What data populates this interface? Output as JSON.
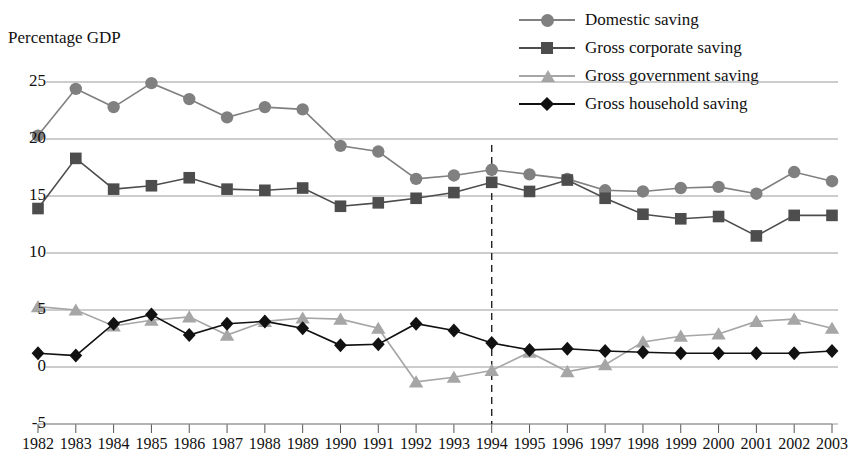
{
  "figure": {
    "title_fragment": "",
    "axis_title": "Percentage GDP"
  },
  "legend": {
    "position": "top-right",
    "items": [
      {
        "label": "Domestic saving",
        "marker": "circle-marker",
        "color": "#808080"
      },
      {
        "label": "Gross corporate saving",
        "marker": "square-marker",
        "color": "#4d4d4d"
      },
      {
        "label": "Gross government saving",
        "marker": "triangle-marker",
        "color": "#a6a6a6"
      },
      {
        "label": "Gross household saving",
        "marker": "diamond-marker",
        "color": "#111111"
      }
    ]
  },
  "annotations": {
    "vline_year": "1994",
    "vline_style": "dashed"
  },
  "chart_data": {
    "type": "line",
    "title": "",
    "xlabel": "",
    "ylabel": "Percentage GDP",
    "ylim": [
      -5,
      27
    ],
    "yticks": [
      -5,
      0,
      5,
      10,
      15,
      20,
      25
    ],
    "grid": true,
    "legend_position": "top-right",
    "x": [
      1982,
      1983,
      1984,
      1985,
      1986,
      1987,
      1988,
      1989,
      1990,
      1991,
      1992,
      1993,
      1994,
      1995,
      1996,
      1997,
      1998,
      1999,
      2000,
      2001,
      2002,
      2003
    ],
    "categories": [
      "1982",
      "1983",
      "1984",
      "1985",
      "1986",
      "1987",
      "1988",
      "1989",
      "1990",
      "1991",
      "1992",
      "1993",
      "1994",
      "1995",
      "1996",
      "1997",
      "1998",
      "1999",
      "2000",
      "2001",
      "2002",
      "2003"
    ],
    "series": [
      {
        "name": "Domestic saving",
        "color": "#808080",
        "marker": "circle",
        "values": [
          20.3,
          24.4,
          22.8,
          24.9,
          23.5,
          21.9,
          22.8,
          22.6,
          19.4,
          18.9,
          16.5,
          16.8,
          17.3,
          16.9,
          16.5,
          15.5,
          15.4,
          15.7,
          15.8,
          15.2,
          17.1,
          16.3
        ]
      },
      {
        "name": "Gross corporate saving",
        "color": "#4d4d4d",
        "marker": "square",
        "values": [
          13.9,
          18.3,
          15.6,
          15.9,
          16.6,
          15.6,
          15.5,
          15.7,
          14.1,
          14.4,
          14.8,
          15.3,
          16.2,
          15.4,
          16.4,
          14.8,
          13.4,
          13.0,
          13.2,
          11.5,
          13.3,
          13.3
        ]
      },
      {
        "name": "Gross government saving",
        "color": "#a6a6a6",
        "marker": "triangle",
        "values": [
          5.3,
          5.0,
          3.6,
          4.1,
          4.4,
          2.8,
          4.0,
          4.3,
          4.2,
          3.4,
          -1.3,
          -0.9,
          -0.3,
          1.3,
          -0.4,
          0.2,
          2.2,
          2.7,
          2.9,
          4.0,
          4.2,
          3.4
        ]
      },
      {
        "name": "Gross household saving",
        "color": "#111111",
        "marker": "diamond",
        "values": [
          1.2,
          1.0,
          3.8,
          4.6,
          2.8,
          3.8,
          4.0,
          3.4,
          1.9,
          2.0,
          3.8,
          3.2,
          2.1,
          1.5,
          1.6,
          1.4,
          1.3,
          1.2,
          1.2,
          1.2,
          1.2,
          1.4
        ]
      }
    ]
  }
}
